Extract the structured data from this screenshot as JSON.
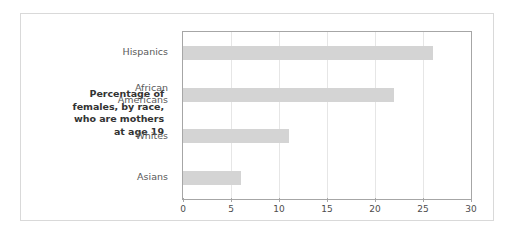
{
  "chart_data": {
    "type": "bar",
    "orientation": "horizontal",
    "title": "Percentage of females, by race, who are mothers at age 19",
    "title_lines": [
      "Percentage of",
      "females, by race,",
      "who are mothers",
      "at age 19"
    ],
    "categories": [
      "Hispanics",
      "African Americans",
      "Whites",
      "Asians"
    ],
    "category_lines": [
      [
        "Hispanics"
      ],
      [
        "African",
        "Americans"
      ],
      [
        "Whites"
      ],
      [
        "Asians"
      ]
    ],
    "values": [
      26,
      22,
      11,
      6
    ],
    "xlabel": "",
    "ylabel": "",
    "xlim": [
      0,
      30
    ],
    "xticks": [
      0,
      5,
      10,
      15,
      20,
      25,
      30
    ],
    "xtick_labels": [
      "0",
      "5",
      "10",
      "15",
      "20",
      "25",
      "30"
    ],
    "grid": true,
    "grid_axis": "x",
    "legend": false,
    "bar_color": "#d4d4d4",
    "axis_color": "#a6a6a6",
    "gridline_color": "#e6e6e6",
    "label_color": "#595959",
    "title_color": "#333333",
    "frame_color": "#d9d9d9",
    "background": "#ffffff"
  }
}
